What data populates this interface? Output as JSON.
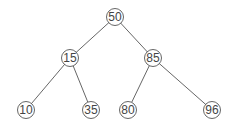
{
  "diagram": {
    "type": "binary-search-tree",
    "nodes": [
      {
        "id": "n50",
        "label": "50",
        "x": 115,
        "y": 17
      },
      {
        "id": "n15",
        "label": "15",
        "x": 70,
        "y": 58
      },
      {
        "id": "n85",
        "label": "85",
        "x": 153,
        "y": 58
      },
      {
        "id": "n10",
        "label": "10",
        "x": 26,
        "y": 110
      },
      {
        "id": "n35",
        "label": "35",
        "x": 91,
        "y": 110
      },
      {
        "id": "n80",
        "label": "80",
        "x": 128,
        "y": 110
      },
      {
        "id": "n96",
        "label": "96",
        "x": 212,
        "y": 110
      }
    ],
    "edges": [
      {
        "from": "n50",
        "to": "n15"
      },
      {
        "from": "n50",
        "to": "n85"
      },
      {
        "from": "n15",
        "to": "n10"
      },
      {
        "from": "n15",
        "to": "n35"
      },
      {
        "from": "n85",
        "to": "n80"
      },
      {
        "from": "n85",
        "to": "n96"
      }
    ],
    "node_radius": 8.5,
    "colors": {
      "stroke": "#555555",
      "text": "#444444",
      "background": "#ffffff"
    }
  }
}
